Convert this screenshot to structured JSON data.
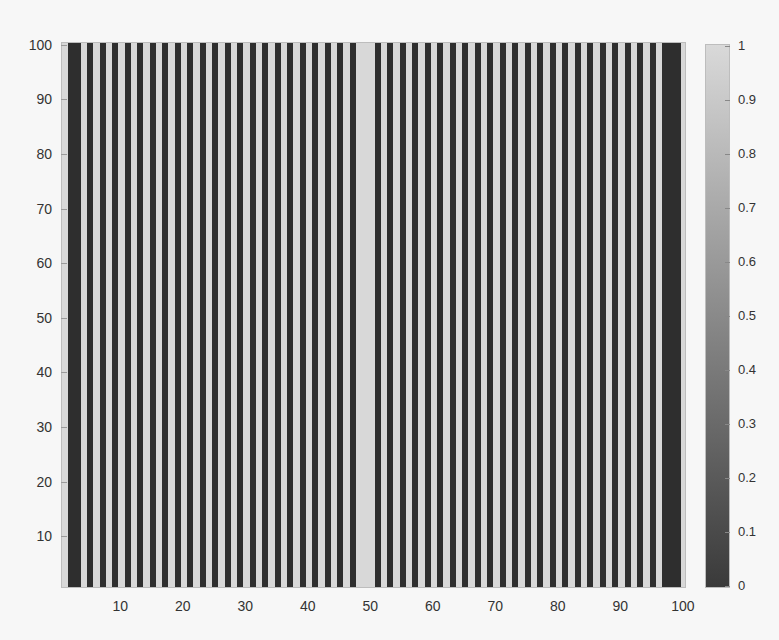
{
  "chart_data": {
    "type": "heatmap",
    "title": "",
    "xlabel": "",
    "ylabel": "",
    "xlim": [
      0.5,
      100.5
    ],
    "ylim": [
      0.5,
      100.5
    ],
    "x_ticks": [
      10,
      20,
      30,
      40,
      50,
      60,
      70,
      80,
      90,
      100
    ],
    "y_ticks": [
      10,
      20,
      30,
      40,
      50,
      60,
      70,
      80,
      90,
      100
    ],
    "colormap": "gray",
    "clim": [
      0,
      1
    ],
    "colorbar": {
      "position": "right",
      "ticks": [
        0,
        0.1,
        0.2,
        0.3,
        0.4,
        0.5,
        0.6,
        0.7,
        0.8,
        0.9,
        1
      ],
      "tick_labels": [
        "0",
        "0.1",
        "0.2",
        "0.3",
        "0.4",
        "0.5",
        "0.6",
        "0.7",
        "0.8",
        "0.9",
        "1"
      ]
    },
    "column_values": [
      1,
      0,
      0,
      1,
      0,
      1,
      0,
      1,
      0,
      1,
      0,
      1,
      0,
      1,
      0,
      1,
      0,
      1,
      0,
      1,
      0,
      1,
      0,
      1,
      0,
      1,
      0,
      1,
      0,
      1,
      0,
      1,
      0,
      1,
      0,
      1,
      0,
      1,
      0,
      1,
      0,
      1,
      0,
      1,
      0,
      1,
      0,
      1,
      1,
      1,
      0,
      1,
      0,
      1,
      0,
      1,
      0,
      1,
      0,
      1,
      0,
      1,
      0,
      1,
      0,
      1,
      0,
      1,
      0,
      1,
      0,
      1,
      0,
      1,
      0,
      1,
      0,
      1,
      0,
      1,
      0,
      1,
      0,
      1,
      0,
      1,
      0,
      1,
      0,
      1,
      0,
      1,
      0,
      1,
      0,
      1,
      0,
      0,
      0,
      1
    ],
    "grid": false
  },
  "colors": {
    "dark": "#2e2e2e",
    "light": "#d8d8d8",
    "background": "#f7f7f7",
    "axis": "#9a9a9a"
  },
  "axes": {
    "x_tick_labels": [
      "10",
      "20",
      "30",
      "40",
      "50",
      "60",
      "70",
      "80",
      "90",
      "100"
    ],
    "y_tick_labels": [
      "10",
      "20",
      "30",
      "40",
      "50",
      "60",
      "70",
      "80",
      "90",
      "100"
    ]
  }
}
